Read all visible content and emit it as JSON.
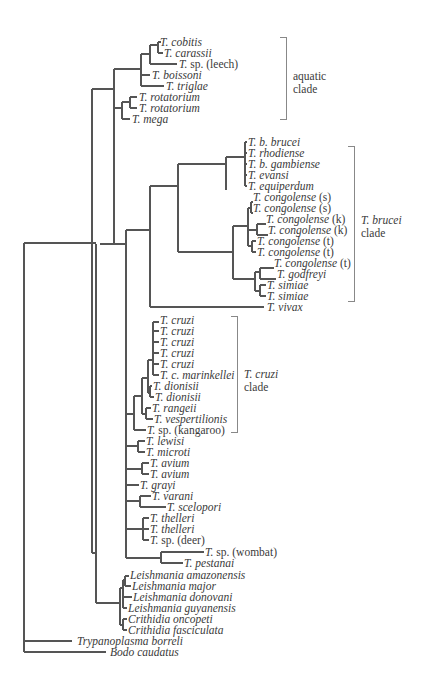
{
  "tree": {
    "stroke": "#555555",
    "taxa": [
      {
        "name": "T. cobitis",
        "suffix": "",
        "x": 160,
        "y": 42
      },
      {
        "name": "T. carassii",
        "suffix": "",
        "x": 164,
        "y": 53
      },
      {
        "name": "T.",
        "suffix": " sp. (leech)",
        "x": 179,
        "y": 64
      },
      {
        "name": "T. boissoni",
        "suffix": "",
        "x": 152,
        "y": 75
      },
      {
        "name": "T. triglae",
        "suffix": "",
        "x": 166,
        "y": 86
      },
      {
        "name": "T. rotatorium",
        "suffix": "",
        "x": 139,
        "y": 97
      },
      {
        "name": "T. rotatorium",
        "suffix": "",
        "x": 139,
        "y": 108
      },
      {
        "name": "T. mega",
        "suffix": "",
        "x": 132,
        "y": 119
      },
      {
        "name": "T. b. brucei",
        "suffix": "",
        "x": 248,
        "y": 142
      },
      {
        "name": "T. rhodiense",
        "suffix": "",
        "x": 248,
        "y": 153
      },
      {
        "name": "T. b. gambiense",
        "suffix": "",
        "x": 248,
        "y": 164
      },
      {
        "name": "T. evansi",
        "suffix": "",
        "x": 248,
        "y": 175
      },
      {
        "name": "T. equiperdum",
        "suffix": "",
        "x": 248,
        "y": 186
      },
      {
        "name": "T. congolense",
        "suffix": " (s)",
        "x": 253,
        "y": 197
      },
      {
        "name": "T. congolense",
        "suffix": " (s)",
        "x": 253,
        "y": 208
      },
      {
        "name": "T. congolense",
        "suffix": " (k)",
        "x": 266,
        "y": 219
      },
      {
        "name": "T. congolense",
        "suffix": " (k)",
        "x": 268,
        "y": 230
      },
      {
        "name": "T. congolense",
        "suffix": " (t)",
        "x": 257,
        "y": 241
      },
      {
        "name": "T. congolense",
        "suffix": " (t)",
        "x": 257,
        "y": 252
      },
      {
        "name": "T. congolense",
        "suffix": " (t)",
        "x": 274,
        "y": 263
      },
      {
        "name": "T. godfreyi",
        "suffix": "",
        "x": 277,
        "y": 274
      },
      {
        "name": "T. simiae",
        "suffix": "",
        "x": 267,
        "y": 285
      },
      {
        "name": "T. simiae",
        "suffix": "",
        "x": 267,
        "y": 296
      },
      {
        "name": "T. vivax",
        "suffix": "",
        "x": 267,
        "y": 307
      },
      {
        "name": "T. cruzi",
        "suffix": "",
        "x": 160,
        "y": 320
      },
      {
        "name": "T. cruzi",
        "suffix": "",
        "x": 160,
        "y": 331
      },
      {
        "name": "T. cruzi",
        "suffix": "",
        "x": 160,
        "y": 342
      },
      {
        "name": "T. cruzi",
        "suffix": "",
        "x": 160,
        "y": 353
      },
      {
        "name": "T. cruzi",
        "suffix": "",
        "x": 160,
        "y": 364
      },
      {
        "name": "T. c. marinkellei",
        "suffix": "",
        "x": 160,
        "y": 375
      },
      {
        "name": "T. dionisii",
        "suffix": "",
        "x": 153,
        "y": 386
      },
      {
        "name": "T. dionisii",
        "suffix": "",
        "x": 155,
        "y": 397
      },
      {
        "name": "T. rangeii",
        "suffix": "",
        "x": 152,
        "y": 408
      },
      {
        "name": "T. vespertilionis",
        "suffix": "",
        "x": 154,
        "y": 419
      },
      {
        "name": "T.",
        "suffix": " sp. (kangaroo)",
        "x": 147,
        "y": 430
      },
      {
        "name": "T. lewisi",
        "suffix": "",
        "x": 146,
        "y": 441
      },
      {
        "name": "T. microti",
        "suffix": "",
        "x": 146,
        "y": 452
      },
      {
        "name": "T. avium",
        "suffix": "",
        "x": 150,
        "y": 463
      },
      {
        "name": "T. avium",
        "suffix": "",
        "x": 150,
        "y": 474
      },
      {
        "name": "T. grayi",
        "suffix": "",
        "x": 140,
        "y": 485
      },
      {
        "name": "T. varani",
        "suffix": "",
        "x": 152,
        "y": 496
      },
      {
        "name": "T. scelopori",
        "suffix": "",
        "x": 167,
        "y": 507
      },
      {
        "name": "T. thelleri",
        "suffix": "",
        "x": 150,
        "y": 518
      },
      {
        "name": "T. thelleri",
        "suffix": "",
        "x": 150,
        "y": 529
      },
      {
        "name": "T.",
        "suffix": " sp. (deer)",
        "x": 150,
        "y": 540
      },
      {
        "name": "T.",
        "suffix": " sp. (wombat)",
        "x": 205,
        "y": 552
      },
      {
        "name": "T. pestanai",
        "suffix": "",
        "x": 184,
        "y": 563
      },
      {
        "name": "Leishmania amazonensis",
        "suffix": "",
        "x": 130,
        "y": 575
      },
      {
        "name": "Leishmania major",
        "suffix": "",
        "x": 132,
        "y": 586
      },
      {
        "name": "Leishmania donovani",
        "suffix": "",
        "x": 133,
        "y": 597
      },
      {
        "name": "Leishmania guyanensis",
        "suffix": "",
        "x": 128,
        "y": 608
      },
      {
        "name": "Crithidia oncopeti",
        "suffix": "",
        "x": 128,
        "y": 619
      },
      {
        "name": "Crithidia fasciculata",
        "suffix": "",
        "x": 128,
        "y": 630
      },
      {
        "name": "Trypanoplasma borreli",
        "suffix": "",
        "x": 77,
        "y": 641
      },
      {
        "name": "Bodo caudatus",
        "suffix": "",
        "x": 110,
        "y": 652
      }
    ],
    "clades": [
      {
        "id": "aquatic",
        "label_italic": "",
        "label_line1": "aquatic",
        "label_line2": "clade",
        "bracket_x": 286,
        "y_top": 37,
        "y_bottom": 119,
        "label_x": 293,
        "label_y": 70
      },
      {
        "id": "brucei",
        "label_italic": "T. brucei",
        "label_line1": "",
        "label_line2": "clade",
        "bracket_x": 354,
        "y_top": 146,
        "y_bottom": 301,
        "label_x": 361,
        "label_y": 214
      },
      {
        "id": "cruzi",
        "label_italic": "T. cruzi",
        "label_line1": "",
        "label_line2": "clade",
        "bracket_x": 237,
        "y_top": 316,
        "y_bottom": 432,
        "label_x": 244,
        "label_y": 368
      }
    ]
  },
  "chart_data": {
    "type": "phylogenetic-tree",
    "title": "",
    "root_outgroups": [
      "Trypanoplasma borreli",
      "Bodo caudatus"
    ],
    "groups": [
      {
        "name": "aquatic clade",
        "members": [
          "T. cobitis",
          "T. carassii",
          "T. sp. (leech)",
          "T. boissoni",
          "T. triglae",
          "T. rotatorium",
          "T. rotatorium",
          "T. mega"
        ]
      },
      {
        "name": "T. brucei clade",
        "members": [
          "T. b. brucei",
          "T. rhodiense",
          "T. b. gambiense",
          "T. evansi",
          "T. equiperdum",
          "T. congolense (s)",
          "T. congolense (s)",
          "T. congolense (k)",
          "T. congolense (k)",
          "T. congolense (t)",
          "T. congolense (t)",
          "T. congolense (t)",
          "T. godfreyi",
          "T. simiae",
          "T. simiae",
          "T. vivax"
        ]
      },
      {
        "name": "T. cruzi clade",
        "members": [
          "T. cruzi",
          "T. cruzi",
          "T. cruzi",
          "T. cruzi",
          "T. cruzi",
          "T. c. marinkellei",
          "T. dionisii",
          "T. dionisii",
          "T. rangeii",
          "T. vespertilionis",
          "T. sp. (kangaroo)"
        ]
      },
      {
        "name": "other trypanosomes",
        "members": [
          "T. lewisi",
          "T. microti",
          "T. avium",
          "T. avium",
          "T. grayi",
          "T. varani",
          "T. scelopori",
          "T. thelleri",
          "T. thelleri",
          "T. sp. (deer)",
          "T. sp. (wombat)",
          "T. pestanai"
        ]
      },
      {
        "name": "trypanosomatid outgroup",
        "members": [
          "Leishmania amazonensis",
          "Leishmania major",
          "Leishmania donovani",
          "Leishmania guyanensis",
          "Crithidia oncopeti",
          "Crithidia fasciculata"
        ]
      }
    ]
  }
}
